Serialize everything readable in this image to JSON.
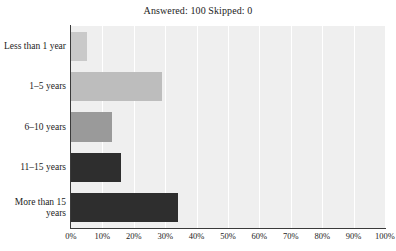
{
  "chart_data": {
    "type": "bar",
    "orientation": "horizontal",
    "title": "Answered: 100  Skipped: 0",
    "xlabel": "",
    "ylabel": "",
    "xlim": [
      0,
      100
    ],
    "grid": true,
    "legend": "none",
    "categories": [
      "Less than 1 year",
      "1–5 years",
      "6–10 years",
      "11–15 years",
      "More than 15 years"
    ],
    "values": [
      5,
      29,
      13,
      16,
      34
    ],
    "bar_colors": [
      "#c9c9c9",
      "#bdbdbd",
      "#9a9a9a",
      "#2e2e2e",
      "#2e2e2e"
    ],
    "xticks": [
      0,
      10,
      20,
      30,
      40,
      50,
      60,
      70,
      80,
      90,
      100
    ],
    "xtick_labels": [
      "0%",
      "10%",
      "20%",
      "30%",
      "40%",
      "50%",
      "60%",
      "70%",
      "80%",
      "90%",
      "100%"
    ],
    "plot_background": "#efefef",
    "gridline_color": "#ffffff",
    "axis_color": "#3a3a3a"
  },
  "chart": {
    "title": "Answered: 100  Skipped: 0"
  }
}
